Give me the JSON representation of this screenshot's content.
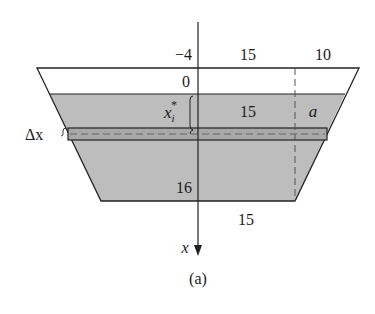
{
  "figure": {
    "caption": "(a)",
    "axis_label": "x",
    "labels": {
      "top_left_depth": "−4",
      "top_half_width": "15",
      "top_extra_width": "10",
      "surface_depth": "0",
      "strip_depth": "x",
      "strip_depth_sub": "i",
      "strip_depth_sup": "*",
      "mid_half_width": "15",
      "strip_extra": "a",
      "strip_thickness": "Δx",
      "bottom_depth": "16",
      "bottom_half_width": "15"
    },
    "colors": {
      "water_fill": "#bdbdbd",
      "strip_fill": "#a8a8a8",
      "line": "#222222",
      "dash": "#555555"
    }
  }
}
